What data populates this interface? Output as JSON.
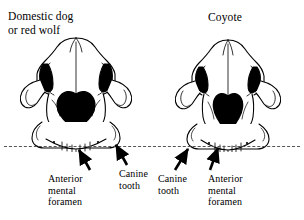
{
  "figure": {
    "background_color": "#ffffff",
    "ink_color": "#000000",
    "guide_line_color": "#555555"
  },
  "specimens": [
    {
      "id": "domestic-dog",
      "title": "Domestic dog\nor red wolf",
      "view": "anterior skull view",
      "nasal_aperture_shape": "broad rounded heart",
      "labels": [
        {
          "id": "anterior-mental-foramen",
          "text": "Anterior\nmental\nforamen"
        },
        {
          "id": "canine-tooth",
          "text": "Canine\ntooth"
        }
      ]
    },
    {
      "id": "coyote",
      "title": "Coyote",
      "view": "anterior skull view",
      "nasal_aperture_shape": "narrow pointed heart",
      "labels": [
        {
          "id": "canine-tooth",
          "text": "Canine\ntooth"
        },
        {
          "id": "anterior-mental-foramen",
          "text": "Anterior\nmental\nforamen"
        }
      ]
    }
  ],
  "guide": {
    "name": "horizontal-comparison-line",
    "style": "dashed"
  }
}
